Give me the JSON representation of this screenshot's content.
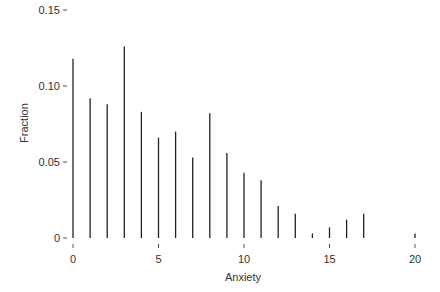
{
  "chart_data": {
    "type": "bar",
    "style": "spike",
    "title": "",
    "xlabel": "Anxiety",
    "ylabel": "Fraction",
    "x": [
      0,
      1,
      2,
      3,
      4,
      5,
      6,
      7,
      8,
      9,
      10,
      11,
      12,
      13,
      14,
      15,
      16,
      17,
      20
    ],
    "values": [
      0.118,
      0.092,
      0.088,
      0.126,
      0.083,
      0.066,
      0.07,
      0.053,
      0.082,
      0.056,
      0.043,
      0.038,
      0.021,
      0.016,
      0.003,
      0.007,
      0.012,
      0.016,
      0.003
    ],
    "xlim": [
      0,
      20
    ],
    "ylim": [
      0,
      0.15
    ],
    "xticks": [
      0,
      5,
      10,
      15,
      20
    ],
    "xtick_labels": [
      "0",
      "5",
      "10",
      "15",
      "20"
    ],
    "yticks": [
      0,
      0.05,
      0.1,
      0.15
    ],
    "ytick_labels": [
      "0",
      "0.05",
      "0.10",
      "0.15"
    ],
    "grid": false,
    "legend": null,
    "colors": {
      "bar": "#222222",
      "axis": "#555555",
      "text": "#333333"
    }
  },
  "layout": {
    "x_px_at_0": 73,
    "x_px_per_unit": 17.1,
    "y_px_at_0": 238,
    "y_px_per_unit": 1520
  }
}
